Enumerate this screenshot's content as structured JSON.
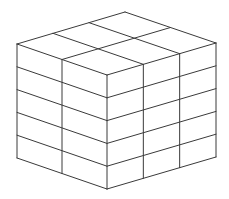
{
  "figure": {
    "title": "Rectangular prism made of unit blocks",
    "dimensions": {
      "left_face_columns": 2,
      "right_face_columns": 3,
      "layers": 5
    },
    "colors": {
      "line": "#3a3a3a",
      "background": "#ffffff"
    }
  }
}
